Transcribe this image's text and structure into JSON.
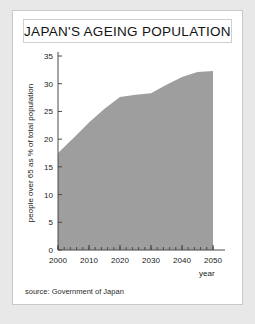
{
  "card": {
    "title": "JAPAN'S AGEING POPULATION",
    "source": "source: Government of Japan"
  },
  "colors": {
    "page_background": "#e8e8e8",
    "card_background": "#ffffff",
    "card_border": "#c9c9c9",
    "area_fill": "#9e9e9e",
    "axis": "#4a4a4a",
    "text": "#1a1a1a"
  },
  "chart_data": {
    "type": "area",
    "title": "JAPAN'S AGEING POPULATION",
    "xlabel": "year",
    "ylabel": "people over 65 as % of total population",
    "x": [
      2000,
      2005,
      2010,
      2015,
      2020,
      2025,
      2030,
      2035,
      2040,
      2045,
      2050
    ],
    "values": [
      17.5,
      20.2,
      23.0,
      25.5,
      27.6,
      28.0,
      28.3,
      29.8,
      31.2,
      32.1,
      32.3
    ],
    "xlim": [
      2000,
      2050
    ],
    "ylim": [
      0,
      35
    ],
    "xticks": [
      2000,
      2010,
      2020,
      2030,
      2040,
      2050
    ],
    "xtick_labels": [
      "2000",
      "2010",
      "2020",
      "2030",
      "2040",
      "2050"
    ],
    "xminor_step": 2,
    "yticks": [
      0,
      5,
      10,
      15,
      20,
      25,
      30,
      35
    ],
    "ytick_labels": [
      "0",
      "5",
      "10",
      "15",
      "20",
      "25",
      "30",
      "35"
    ],
    "grid": false,
    "legend": "none",
    "series": [
      {
        "name": "people over 65 as % of total population",
        "values": [
          17.5,
          20.2,
          23.0,
          25.5,
          27.6,
          28.0,
          28.3,
          29.8,
          31.2,
          32.1,
          32.3
        ]
      }
    ]
  }
}
